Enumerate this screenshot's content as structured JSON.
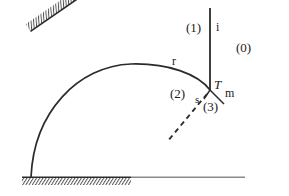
{
  "figure": {
    "canvas": {
      "width": 289,
      "height": 196
    },
    "colors": {
      "stroke": "#2b2b2b",
      "hatch": "#3a3a3a",
      "ground_right": "#8a8a8a",
      "background": "#ffffff",
      "text": "#1a1a1a"
    },
    "labels": {
      "region_one": "(1)",
      "region_zero": "(0)",
      "region_two": "(2)",
      "region_three": "(3)",
      "incident_ray": "i",
      "reflected_ray": "r",
      "transmitted_point": "T",
      "medium_m": "m",
      "surface_s": "s"
    },
    "geometry": {
      "incident_line": {
        "x1": 210,
        "y1": 8,
        "x2": 210,
        "y2": 90
      },
      "arc": {
        "start_x": 31,
        "start_y": 177,
        "apex_x": 145,
        "apex_y": 66,
        "end_x": 210,
        "end_y": 90
      },
      "ground_line": {
        "x1": 22,
        "y1": 177,
        "x2": 245,
        "y2": 177
      },
      "ground_hatch_end_x": 131,
      "incline": {
        "x1": 131,
        "y1": 177,
        "x2": 283,
        "y2": 72
      },
      "dashed_ray": {
        "x1": 207,
        "y1": 95,
        "x2": 168,
        "y2": 141
      },
      "short_ray": {
        "x1": 210,
        "y1": 90,
        "x2": 223,
        "y2": 103
      }
    },
    "label_positions": {
      "region_one": {
        "x": 186,
        "y": 21
      },
      "incident_ray": {
        "x": 216,
        "y": 21
      },
      "region_zero": {
        "x": 236,
        "y": 41
      },
      "reflected_ray": {
        "x": 172,
        "y": 55
      },
      "transmitted_point": {
        "x": 214,
        "y": 79
      },
      "medium_m": {
        "x": 224,
        "y": 87
      },
      "region_two": {
        "x": 170,
        "y": 87
      },
      "surface_s": {
        "x": 195,
        "y": 94
      },
      "region_three": {
        "x": 202,
        "y": 100
      }
    }
  }
}
